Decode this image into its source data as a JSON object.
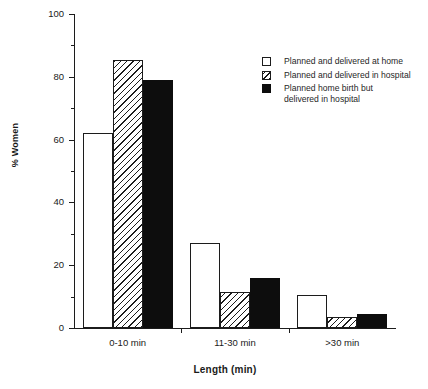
{
  "chart_data": {
    "type": "bar",
    "title": "",
    "subtitle": "",
    "xlabel": "Length (min)",
    "ylabel": "% Women",
    "categories": [
      "0-10 min",
      "11-30 min",
      ">30 min"
    ],
    "series": [
      {
        "name": "Planned and delivered at home",
        "fill": "open",
        "values": [
          62,
          27,
          10.5
        ]
      },
      {
        "name": "Planned and delivered in hospital",
        "fill": "hatch",
        "values": [
          85.5,
          11.5,
          3.5
        ]
      },
      {
        "name": "Planned home birth but\ndelivered in hospital",
        "fill": "solid",
        "values": [
          79,
          16,
          4.5
        ]
      }
    ],
    "ylim": [
      0,
      100
    ],
    "ytick_labels": [
      "0",
      "20",
      "40",
      "60",
      "80",
      "100"
    ],
    "ytick_values": [
      0,
      20,
      40,
      60,
      80,
      100
    ],
    "yminor_values": [
      10,
      30,
      50,
      70,
      90
    ],
    "grid": false,
    "legend_position": "upper right",
    "colors": {
      "axis": "#1c1c1c",
      "solid_fill": "#0d0d0d",
      "open_fill": "#ffffff",
      "background": "#ffffff"
    }
  }
}
